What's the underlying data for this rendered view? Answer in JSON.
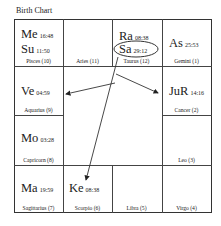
{
  "title": "Birth Chart",
  "houses": {
    "pisces": {
      "sign": "Pisces (10)",
      "planets": [
        {
          "name": "Me",
          "deg": "16:48"
        },
        {
          "name": "Su",
          "deg": "11:50"
        }
      ]
    },
    "aries": {
      "sign": "Aries (11)",
      "planets": []
    },
    "taurus": {
      "sign": "Taurus (12)",
      "planets": [
        {
          "name": "Ra",
          "deg": "08:38"
        },
        {
          "name": "Sa",
          "deg": "29:12"
        }
      ]
    },
    "gemini": {
      "sign": "Gemini (1)",
      "planets": [
        {
          "name": "As",
          "deg": "25:53"
        }
      ]
    },
    "aquarius": {
      "sign": "Aquarius (9)",
      "planets": [
        {
          "name": "Ve",
          "deg": "04:59"
        }
      ]
    },
    "cancer": {
      "sign": "Cancer (2)",
      "planets": [
        {
          "name": "JuR",
          "deg": "14:16"
        }
      ]
    },
    "capricorn": {
      "sign": "Capricorn (8)",
      "planets": [
        {
          "name": "Mo",
          "deg": "03:28"
        }
      ]
    },
    "leo": {
      "sign": "Leo (3)",
      "planets": []
    },
    "sagittarius": {
      "sign": "Sagittarius (7)",
      "planets": [
        {
          "name": "Ma",
          "deg": "19:59"
        }
      ]
    },
    "scorpio": {
      "sign": "Scorpio (6)",
      "planets": [
        {
          "name": "Ke",
          "deg": "08:38"
        }
      ]
    },
    "libra": {
      "sign": "Libra (5)",
      "planets": []
    },
    "virgo": {
      "sign": "Virgo (4)",
      "planets": []
    }
  },
  "highlight": "Sa",
  "aspects_from": "Sa",
  "aspects_to": [
    "Ve",
    "JuR",
    "Ke"
  ]
}
